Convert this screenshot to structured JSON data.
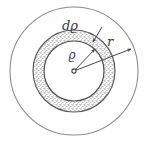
{
  "figure": {
    "background_color": "#ffffff",
    "ink_color": "#4a4a4a",
    "stipple_color": "#6b6b6b",
    "labels": {
      "outer_radius": "r",
      "inner_radius": "ϱ",
      "shell_thickness": "dϱ"
    },
    "geometry": {
      "center_x": 74,
      "center_y": 71,
      "outer_circle_radius": 64,
      "shell_outer_radius": 41,
      "shell_inner_radius": 30,
      "center_dot_radius": 2
    },
    "annotations": [
      {
        "name": "outer-radius-arrow",
        "label": "r",
        "from_x": 74,
        "from_y": 71,
        "to_x": 131,
        "to_y": 49,
        "label_x": 110,
        "label_y": 46
      },
      {
        "name": "inner-radius-arrow",
        "label": "ϱ",
        "from_x": 74,
        "from_y": 71,
        "to_x": 95,
        "to_y": 49,
        "label_x": 72,
        "label_y": 58
      },
      {
        "name": "shell-thickness-arrow",
        "label": "dϱ",
        "from_x": 102,
        "from_y": 27,
        "to_x": 93,
        "to_y": 42,
        "label_x": 70,
        "label_y": 30
      }
    ]
  }
}
